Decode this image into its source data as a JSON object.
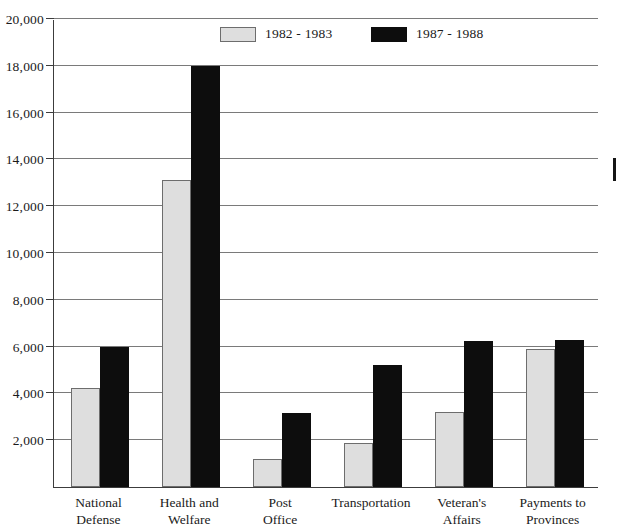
{
  "chart_data": {
    "type": "bar",
    "title": "",
    "subtitle": "",
    "xlabel": "",
    "ylabel": "",
    "ylim": [
      0,
      20000
    ],
    "ytick_interval": 2000,
    "ytick_labels": [
      "20,000",
      "18,000",
      "16,000",
      "14,000",
      "12,000",
      "10,000",
      "8,000",
      "6,000",
      "4,000",
      "2,000"
    ],
    "ytick_values": [
      20000,
      18000,
      16000,
      14000,
      12000,
      10000,
      8000,
      6000,
      4000,
      2000
    ],
    "grid": true,
    "legend_position": "top-center",
    "categories": [
      "National\nDefense",
      "Health and\nWelfare",
      "Post\nOffice",
      "Transportation",
      "Veteran's\nAffairs",
      "Payments to\nProvinces"
    ],
    "series": [
      {
        "name": "1982 - 1983",
        "color": "#dedede",
        "values": [
          4250,
          13100,
          1200,
          1900,
          3200,
          5900
        ]
      },
      {
        "name": "1987 - 1988",
        "color": "#0d0d0d",
        "values": [
          6000,
          18000,
          3150,
          5200,
          6250,
          6300
        ]
      }
    ]
  },
  "legend": {
    "items": [
      {
        "label": "1982 - 1983",
        "swatch": "gray"
      },
      {
        "label": "1987 - 1988",
        "swatch": "black"
      }
    ]
  },
  "axis": {
    "y_labels": [
      "20,000",
      "18,000",
      "16,000",
      "14,000",
      "12,000",
      "10,000",
      "8,000",
      "6,000",
      "4,000",
      "2,000"
    ]
  }
}
